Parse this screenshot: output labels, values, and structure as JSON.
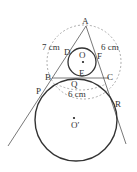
{
  "diagram": {
    "points": {
      "A": "A",
      "B": "B",
      "C": "C",
      "D": "D",
      "E": "E",
      "F": "F",
      "O": "O",
      "O_prime": "O′",
      "P": "P",
      "Q": "Q",
      "R": "R"
    },
    "measurements": {
      "AB": "7 cm",
      "AC": "6 cm",
      "BC": "6 cm"
    },
    "colors": {
      "stroke": "#333333",
      "dashed": "#999999"
    }
  }
}
